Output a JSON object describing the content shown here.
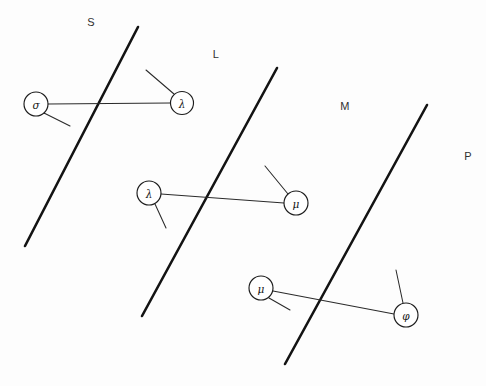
{
  "diagram": {
    "background_color": "#fdfdfd",
    "stroke_color": "#131313",
    "node_fill": "#ffffff",
    "width": 486,
    "height": 386,
    "region_labels": [
      {
        "text": "S",
        "x": 91,
        "y": 22
      },
      {
        "text": "L",
        "x": 216,
        "y": 54
      },
      {
        "text": "M",
        "x": 345,
        "y": 106
      },
      {
        "text": "P",
        "x": 468,
        "y": 156
      }
    ],
    "barriers": [
      {
        "name": "barrier-s",
        "x1": 25,
        "y1": 246,
        "x2": 138,
        "y2": 27
      },
      {
        "name": "barrier-l",
        "x1": 142,
        "y1": 316,
        "x2": 277,
        "y2": 68
      },
      {
        "name": "barrier-m",
        "x1": 285,
        "y1": 364,
        "x2": 427,
        "y2": 105
      }
    ],
    "groups": [
      {
        "name": "group-sigma-lambda",
        "left_node": {
          "label": "σ",
          "cx": 36,
          "cy": 104,
          "r": 12
        },
        "right_node": {
          "label": "λ",
          "cx": 182,
          "cy": 103,
          "r": 11.5
        },
        "link": {
          "x1": 48,
          "y1": 104,
          "x2": 170,
          "y2": 103
        },
        "left_stub": {
          "x1": 44,
          "y1": 113,
          "x2": 70,
          "y2": 126
        },
        "right_stub": {
          "x1": 174,
          "y1": 94,
          "x2": 146,
          "y2": 70
        }
      },
      {
        "name": "group-lambda-mu",
        "left_node": {
          "label": "λ",
          "cx": 149,
          "cy": 193,
          "r": 12
        },
        "right_node": {
          "label": "μ",
          "cx": 296,
          "cy": 203,
          "r": 12
        },
        "link": {
          "x1": 161,
          "y1": 194,
          "x2": 284,
          "y2": 203
        },
        "left_stub": {
          "x1": 155,
          "y1": 204,
          "x2": 166,
          "y2": 228
        },
        "right_stub": {
          "x1": 288,
          "y1": 194,
          "x2": 265,
          "y2": 166
        }
      },
      {
        "name": "group-mu-phi",
        "left_node": {
          "label": "μ",
          "cx": 261,
          "cy": 288,
          "r": 12
        },
        "right_node": {
          "label": "φ",
          "cx": 406,
          "cy": 315,
          "r": 12
        },
        "link": {
          "x1": 273,
          "y1": 291,
          "x2": 394,
          "y2": 314
        },
        "left_stub": {
          "x1": 269,
          "y1": 298,
          "x2": 290,
          "y2": 310
        },
        "right_stub": {
          "x1": 403,
          "y1": 303,
          "x2": 396,
          "y2": 270
        }
      }
    ]
  }
}
